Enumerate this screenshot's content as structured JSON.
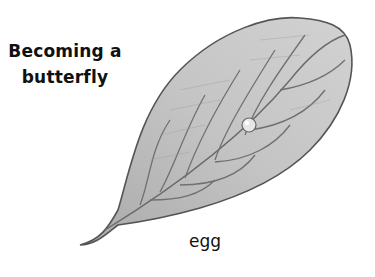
{
  "title": {
    "line1": "Becoming a",
    "line2": "butterfly"
  },
  "illustration": {
    "subject": "leaf",
    "label": "egg"
  },
  "colors": {
    "leaf_fill": "#bdbdbd",
    "leaf_outline": "#555555",
    "text": "#111111",
    "background": "#ffffff"
  }
}
